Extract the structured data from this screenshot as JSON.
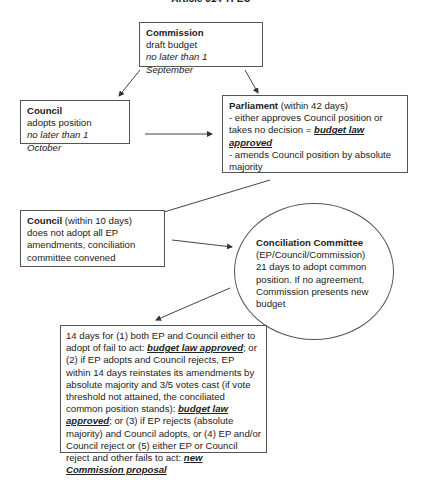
{
  "title": "Article 314 TFEU",
  "commission": {
    "heading": "Commission",
    "line1": "draft budget",
    "line2": "no later than 1 September"
  },
  "council1": {
    "heading": "Council",
    "line1": "adopts position",
    "line2": "no later than 1 October"
  },
  "parliament": {
    "heading": "Parliament",
    "heading_suffix": " (within 42 days)",
    "line1": "- either approves Council position or takes no decision = ",
    "emph": "budget law approved",
    "line2": "- amends Council position by absolute majority"
  },
  "council2": {
    "heading": "Council",
    "heading_suffix": " (within 10 days)",
    "body": "does not adopt all EP amendments, conciliation committee convened"
  },
  "conciliation": {
    "heading": "Conciliation Committee",
    "line1": "(EP/Council/Commission)",
    "body": "21 days to adopt common position. If no agreement, Commission presents new budget"
  },
  "outcome": {
    "part1": "14 days for (1) both EP and Council either to adopt of fail to act: ",
    "emph1": "budget law approved",
    "part2": "; or (2) if EP adopts and Council rejects, EP within 14 days reinstates its amendments by absolute majority and 3/5 votes cast (if vote threshold not attained, the conciliated common position stands): ",
    "emph2": "budget law approved",
    "part3": "; or (3) if EP rejects (absolute majority) and Council adopts, or (4) EP and/or Council reject or (5) either EP or Council reject and other fails to act: ",
    "emph3": "new Commission proposal"
  }
}
